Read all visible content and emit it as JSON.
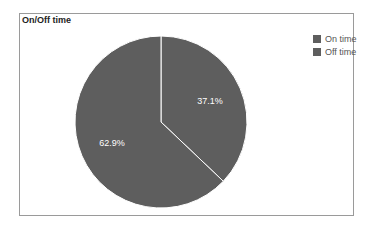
{
  "chart_data": {
    "type": "pie",
    "title": "On/Off time",
    "categories": [
      "On time",
      "Off time"
    ],
    "values": [
      37.1,
      62.9
    ],
    "labels": [
      "37.1%",
      "62.9%"
    ],
    "colors": [
      "#5e5e5e",
      "#5e5e5e"
    ],
    "legend_position": "right",
    "start_angle_deg": 0,
    "direction": "clockwise"
  },
  "legend": {
    "items": [
      {
        "label": "On time",
        "color": "#5e5e5e"
      },
      {
        "label": "Off time",
        "color": "#5e5e5e"
      }
    ]
  }
}
